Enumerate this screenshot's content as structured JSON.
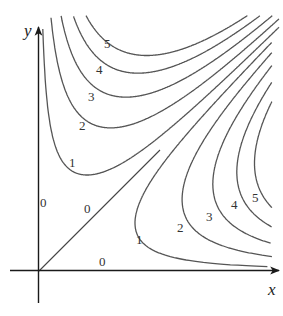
{
  "chart_data": {
    "type": "contour",
    "title": "",
    "xlabel": "x",
    "ylabel": "y",
    "function_hint": "level curves symmetric about y = x; value 0 on x-axis, y-axis and line y = x",
    "zero_contours": [
      "x-axis",
      "y-axis",
      "line y = x"
    ],
    "level_labels": [
      "0",
      "1",
      "2",
      "3",
      "4",
      "5"
    ],
    "regions": [
      {
        "name": "upper-left (y > x)",
        "levels": [
          1,
          2,
          3,
          4,
          5
        ]
      },
      {
        "name": "lower-right (x > y)",
        "levels": [
          1,
          2,
          3,
          4,
          5
        ]
      }
    ],
    "xlim": [
      0,
      10
    ],
    "ylim": [
      0,
      10
    ],
    "grid": false,
    "legend": "none"
  },
  "geometry": {
    "origin": [
      39,
      271
    ],
    "scale": 24,
    "levels": [
      16,
      53,
      95,
      140,
      181
    ]
  },
  "labels": {
    "x_axis": "x",
    "y_axis": "y",
    "zero_y_axis": "0",
    "zero_diagonal": "0",
    "zero_x_axis": "0",
    "upper": [
      "1",
      "2",
      "3",
      "4",
      "5"
    ],
    "lower": [
      "1",
      "2",
      "3",
      "4",
      "5"
    ]
  }
}
